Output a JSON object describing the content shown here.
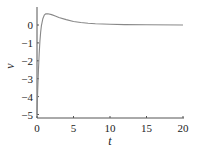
{
  "chart_data": {
    "type": "line",
    "title": "",
    "xlabel": "t",
    "ylabel": "v",
    "xlim": [
      0,
      20
    ],
    "ylim": [
      -5.2,
      0.9
    ],
    "xticks": [
      0,
      5,
      10,
      15,
      20
    ],
    "yticks": [
      0,
      -1,
      -2,
      -3,
      -4,
      -5
    ],
    "grid": false,
    "legend": null,
    "series": [
      {
        "name": "v(t)",
        "color": "#888888",
        "x": [
          0,
          0.1,
          0.2,
          0.3,
          0.4,
          0.5,
          0.6,
          0.8,
          1.0,
          1.2,
          1.5,
          2.0,
          2.5,
          3,
          4,
          5,
          6,
          7,
          8,
          10,
          12,
          15,
          20
        ],
        "y": [
          -5.0,
          -3.6,
          -2.5,
          -1.6,
          -0.9,
          -0.4,
          -0.05,
          0.35,
          0.55,
          0.62,
          0.63,
          0.58,
          0.5,
          0.42,
          0.3,
          0.2,
          0.14,
          0.1,
          0.07,
          0.04,
          0.02,
          0.01,
          0.0
        ]
      }
    ]
  },
  "axes": {
    "x_ticks": [
      "0",
      "5",
      "10",
      "15",
      "20"
    ],
    "y_ticks": [
      "0",
      "−1",
      "−2",
      "−3",
      "−4",
      "−5"
    ],
    "xlabel": "t",
    "ylabel": "v"
  }
}
